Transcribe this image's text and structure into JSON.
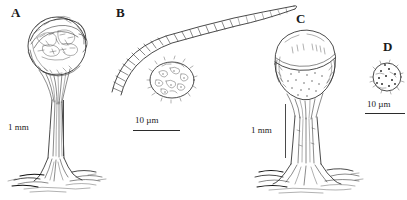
{
  "figure": {
    "background_color": "#ffffff",
    "ink_color": "#1d1d1d",
    "width": 407,
    "height": 200
  },
  "panels": [
    {
      "letter": "A",
      "subject": "stalked fruiting body with shaggy ruptured head and basal rhizomorphs",
      "scalebar": {
        "label": "1 mm",
        "orientation": "vertical"
      }
    },
    {
      "letter": "B",
      "subject": "curved septate hypha with striations and ornamented oval spore",
      "scalebar": {
        "label": "10 µm",
        "orientation": "horizontal"
      }
    },
    {
      "letter": "C",
      "subject": "stalked fruiting body with intact dome-shaped head and basal rhizomorphs",
      "scalebar": {
        "label": "1 mm",
        "orientation": "vertical"
      }
    },
    {
      "letter": "D",
      "subject": "single globose ornamented spore",
      "scalebar": {
        "label": "10 µm",
        "orientation": "horizontal"
      }
    }
  ]
}
